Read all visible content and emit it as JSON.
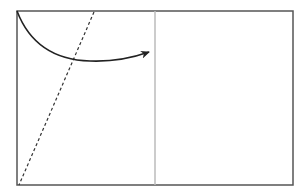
{
  "diagram": {
    "canvas": {
      "width": 307,
      "height": 196,
      "background": "#ffffff"
    },
    "frame": {
      "x": 17,
      "y": 11,
      "width": 276,
      "height": 174,
      "stroke": "#555555",
      "stroke_width": 1.5
    },
    "divider": {
      "x": 155,
      "y1": 11,
      "y2": 185,
      "stroke": "#bbbbbb",
      "stroke_width": 1.5
    },
    "curve_arrow": {
      "path": "M17,11 C30,45 55,60 90,61 C115,62 132,58 149,52",
      "stroke": "#222222",
      "stroke_width": 1.6,
      "arrow_tip": [
        149,
        52
      ]
    },
    "dashed_line": {
      "x1": 94,
      "y1": 12,
      "x2": 19,
      "y2": 185,
      "stroke": "#333333",
      "stroke_width": 1.2,
      "dasharray": "3,2.5"
    },
    "intersection_point": [
      73,
      59
    ]
  }
}
